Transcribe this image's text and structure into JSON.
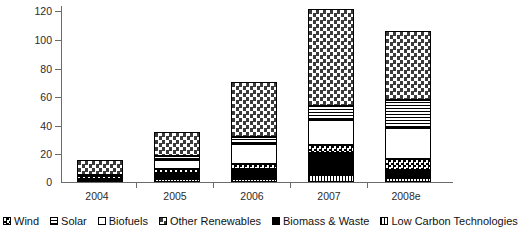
{
  "chart_data": {
    "type": "bar",
    "subtype": "stacked-bar",
    "title": "",
    "xlabel": "",
    "ylabel": "",
    "categories": [
      "2004",
      "2005",
      "2006",
      "2007",
      "2008e"
    ],
    "ylim": [
      0,
      120
    ],
    "yticks": [
      0,
      20,
      40,
      60,
      80,
      100,
      120
    ],
    "ytick_labels": [
      "0",
      "20",
      "40",
      "60",
      "80",
      "100",
      "120"
    ],
    "grid": false,
    "legend_position": "bottom",
    "stack_order_bottom_to_top": [
      "Low Carbon Technologies",
      "Biomass & Waste",
      "Wind",
      "Biofuels",
      "Solar",
      "Other Renewables"
    ],
    "series": [
      {
        "name": "Low Carbon Technologies",
        "pattern": "vertical-lines",
        "values": [
          1,
          2,
          2,
          5,
          3
        ]
      },
      {
        "name": "Biomass & Waste",
        "pattern": "solid-black",
        "values": [
          1,
          4,
          7,
          15,
          5
        ]
      },
      {
        "name": "Wind",
        "pattern": "small-checker",
        "values": [
          2,
          3,
          3,
          5,
          8
        ]
      },
      {
        "name": "Biofuels",
        "pattern": "white",
        "values": [
          0,
          6,
          14,
          17,
          21
        ]
      },
      {
        "name": "Solar",
        "pattern": "horizontal-lines",
        "values": [
          1,
          3,
          5,
          10,
          19
        ]
      },
      {
        "name": "Other Renewables",
        "pattern": "large-checker",
        "values": [
          10,
          16,
          37,
          66,
          47
        ]
      }
    ],
    "totals": [
      15,
      34,
      68,
      118,
      103
    ]
  },
  "legend": {
    "items": [
      {
        "label": "Wind",
        "key": "wind"
      },
      {
        "label": "Solar",
        "key": "solar"
      },
      {
        "label": "Biofuels",
        "key": "biofuels"
      },
      {
        "label": "Other Renewables",
        "key": "other"
      },
      {
        "label": "Biomass & Waste",
        "key": "biomass"
      },
      {
        "label": "Low Carbon Technologies",
        "key": "lowcarbon"
      }
    ]
  },
  "axis": {
    "y_labels": [
      "120",
      "100",
      "80",
      "60",
      "40",
      "20",
      "0"
    ],
    "x_labels": [
      "2004",
      "2005",
      "2006",
      "2007",
      "2008e"
    ]
  }
}
